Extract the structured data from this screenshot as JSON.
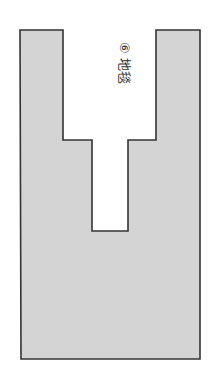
{
  "diagram": {
    "type": "floor-plan-shape",
    "shape_fill": "#d4d4d4",
    "shape_stroke": "#333333",
    "label": {
      "number": "⑥",
      "text": "地毯",
      "full": "⑥ 地毯",
      "orientation": "rotated-90-clockwise"
    },
    "outline_points": [
      [
        19,
        30
      ],
      [
        63,
        30
      ],
      [
        63,
        140
      ],
      [
        92,
        140
      ],
      [
        92,
        231
      ],
      [
        128,
        231
      ],
      [
        128,
        140
      ],
      [
        156,
        140
      ],
      [
        156,
        30
      ],
      [
        200,
        30
      ],
      [
        200,
        359
      ],
      [
        21,
        359
      ]
    ]
  }
}
